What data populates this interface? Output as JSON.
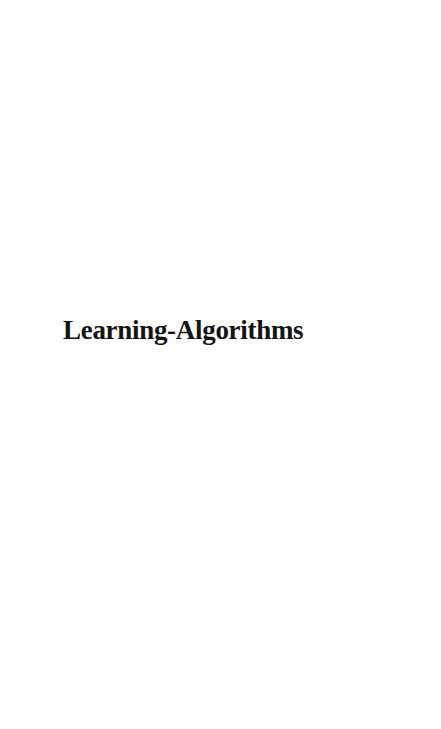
{
  "page": {
    "title": "Learning-Algorithms",
    "background_color": "#fdfdfd",
    "text_color": "#141414"
  }
}
